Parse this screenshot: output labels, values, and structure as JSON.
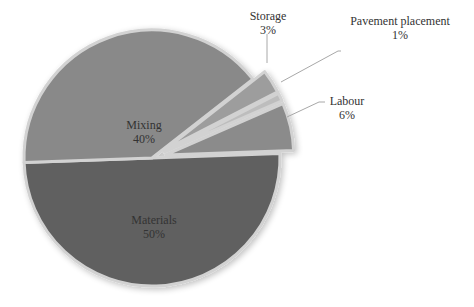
{
  "chart_data": {
    "type": "pie",
    "title": "",
    "categories": [
      "Materials",
      "Mixing",
      "Storage",
      "Pavement placement",
      "Labour"
    ],
    "values": [
      50,
      40,
      3,
      1,
      6
    ],
    "unit": "%",
    "labels": [
      {
        "name": "Materials",
        "pct": "50%"
      },
      {
        "name": "Mixing",
        "pct": "40%"
      },
      {
        "name": "Storage",
        "pct": "3%"
      },
      {
        "name": "Pavement placement",
        "pct": "1%"
      },
      {
        "name": "Labour",
        "pct": "6%"
      }
    ],
    "colors": [
      "#606060",
      "#898989",
      "#9d9d9d",
      "#bdbdbd",
      "#8b8b8b"
    ],
    "exploded": [
      "Storage",
      "Pavement placement",
      "Labour"
    ],
    "legend": "none"
  }
}
